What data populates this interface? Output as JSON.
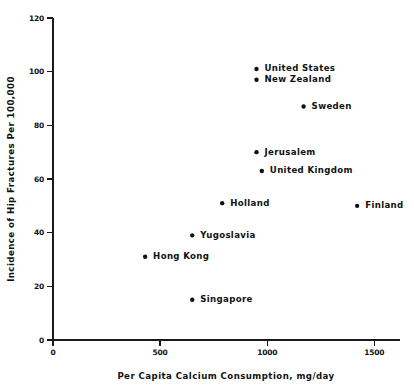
{
  "chart_data": {
    "type": "scatter",
    "title": "",
    "xlabel": "Per Capita Calcium Consumption, mg/day",
    "ylabel": "Incidence of Hip Fractures Per 100,000",
    "xlim": [
      0,
      1620
    ],
    "ylim": [
      0,
      120
    ],
    "xticks": [
      0,
      500,
      1000,
      1500
    ],
    "xtick_labels": [
      "0",
      "500",
      "1000",
      "1500"
    ],
    "yticks": [
      0,
      20,
      40,
      60,
      80,
      100,
      120
    ],
    "ytick_labels": [
      "0",
      "20",
      "40",
      "60",
      "80",
      "100",
      "120"
    ],
    "grid": false,
    "legend": "none",
    "marker_color": "#111111",
    "axis_color": "#1a1a1a",
    "points": [
      {
        "label": "United States",
        "x": 950,
        "y": 101,
        "label_dx": 8,
        "label_dy": 0
      },
      {
        "label": "New Zealand",
        "x": 950,
        "y": 97,
        "label_dx": 8,
        "label_dy": 0
      },
      {
        "label": "Sweden",
        "x": 1170,
        "y": 87,
        "label_dx": 8,
        "label_dy": 0
      },
      {
        "label": "Jerusalem",
        "x": 950,
        "y": 70,
        "label_dx": 8,
        "label_dy": 0
      },
      {
        "label": "United Kingdom",
        "x": 975,
        "y": 63,
        "label_dx": 8,
        "label_dy": 0
      },
      {
        "label": "Holland",
        "x": 790,
        "y": 51,
        "label_dx": 8,
        "label_dy": 0
      },
      {
        "label": "Finland",
        "x": 1420,
        "y": 50,
        "label_dx": 8,
        "label_dy": 0
      },
      {
        "label": "Yugoslavia",
        "x": 650,
        "y": 39,
        "label_dx": 8,
        "label_dy": 0
      },
      {
        "label": "Hong Kong",
        "x": 430,
        "y": 31,
        "label_dx": 8,
        "label_dy": 0
      },
      {
        "label": "Singapore",
        "x": 650,
        "y": 15,
        "label_dx": 8,
        "label_dy": 0
      }
    ]
  }
}
